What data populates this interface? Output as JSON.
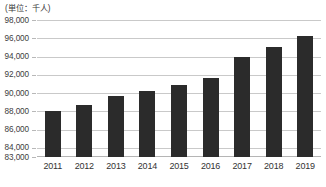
{
  "caption": {
    "unit_note": "(単位：千人)"
  },
  "chart_data": {
    "type": "bar",
    "title": "",
    "subtitle": "",
    "xlabel": "",
    "ylabel": "(単位：千人)",
    "categories": [
      "2011",
      "2012",
      "2013",
      "2014",
      "2015",
      "2016",
      "2017",
      "2018",
      "2019"
    ],
    "values": [
      88000,
      88700,
      89700,
      90200,
      90900,
      91700,
      93900,
      95000,
      96200
    ],
    "series": [
      {
        "name": "人口",
        "values": [
          88000,
          88700,
          89700,
          90200,
          90900,
          91700,
          93900,
          95000,
          96200
        ]
      }
    ],
    "ylim": [
      83000,
      98000
    ],
    "yticks": [
      83000,
      84000,
      86000,
      88000,
      90000,
      92000,
      94000,
      96000,
      98000
    ],
    "ytick_labels": [
      "83,000",
      "84,000",
      "86,000",
      "88,000",
      "90,000",
      "92,000",
      "94,000",
      "96,000",
      "98,000"
    ],
    "grid": true,
    "legend": "none",
    "bar_color": "#2b2b2b",
    "gridline_color": "#c9c9c9",
    "background_color": "#ffffff"
  }
}
